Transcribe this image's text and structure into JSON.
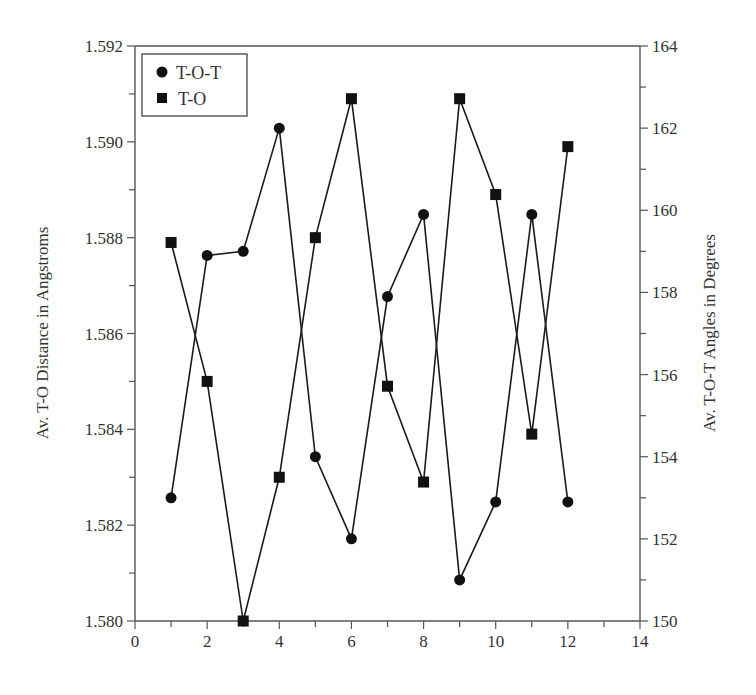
{
  "chart_data": {
    "type": "line",
    "title": "",
    "xlabel": "",
    "ylabel_left": "Av. T-O Distance in Angstroms",
    "ylabel_right": "Av. T-O-T Angles in Degrees",
    "xlim": [
      0,
      14
    ],
    "ylim_left": [
      1.58,
      1.592
    ],
    "ylim_right": [
      150,
      164
    ],
    "x_ticks": [
      "0",
      "2",
      "4",
      "6",
      "8",
      "10",
      "12",
      "14"
    ],
    "y_left_ticks": [
      "1.580",
      "1.582",
      "1.584",
      "1.586",
      "1.588",
      "1.590",
      "1.592"
    ],
    "y_right_ticks": [
      "150",
      "152",
      "154",
      "156",
      "158",
      "160",
      "162",
      "164"
    ],
    "grid": false,
    "legend_position": "upper left",
    "x": [
      1,
      2,
      3,
      4,
      5,
      6,
      7,
      8,
      9,
      10,
      11,
      12
    ],
    "series": [
      {
        "name": "T-O-T",
        "marker": "circle",
        "axis": "right",
        "values": [
          153.0,
          158.9,
          159.0,
          162.0,
          154.0,
          152.0,
          157.9,
          159.9,
          151.0,
          152.9,
          159.9,
          152.9
        ]
      },
      {
        "name": "T-O",
        "marker": "square",
        "axis": "left",
        "values": [
          1.5879,
          1.585,
          1.58,
          1.583,
          1.588,
          1.5909,
          1.5849,
          1.5829,
          1.5909,
          1.5889,
          1.5839,
          1.5899
        ]
      }
    ]
  },
  "colors": {
    "line": "#1a1a1a",
    "axis": "#555555",
    "text": "#333333"
  }
}
